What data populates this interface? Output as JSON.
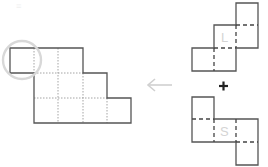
{
  "diagram": {
    "title": "",
    "colors": {
      "outline": "#555555",
      "grid_dotted": "#9a9a9a",
      "fold_dashed": "#444444",
      "highlight_circle": "#d8d8d8",
      "arrow": "#d0d0d0",
      "plus": "#222222",
      "piece_label": "#d4d4d4"
    },
    "target_shape": {
      "description": "Staircase grid of squares (rows of 3, 4, 5 squares, offset)",
      "rows": [
        {
          "row": 0,
          "start_col": 0,
          "end_col": 3
        },
        {
          "row": 1,
          "start_col": 1,
          "end_col": 4
        },
        {
          "row": 2,
          "start_col": 1,
          "end_col": 5
        }
      ],
      "highlighted_cell": {
        "row": 0,
        "col": 0
      }
    },
    "arrow": {
      "direction": "left",
      "glyph": "←"
    },
    "operator": {
      "glyph": "+"
    },
    "pieces": [
      {
        "name": "L",
        "label": "L"
      },
      {
        "name": "S",
        "label": "S"
      }
    ],
    "corner_mark": "≡"
  }
}
